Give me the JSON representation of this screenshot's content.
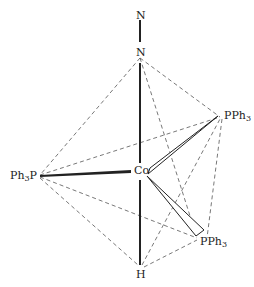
{
  "diagram": {
    "type": "molecular-structure",
    "atoms": {
      "n_terminal": {
        "label": "N",
        "x": 140,
        "y": 15
      },
      "n_bonded": {
        "label": "N",
        "x": 140,
        "y": 52
      },
      "co": {
        "label": "Co",
        "x": 140,
        "y": 170
      },
      "p_left": {
        "label": "Ph",
        "sub": "3",
        "tail": "P",
        "x": 38,
        "y": 175
      },
      "p_upper_right": {
        "label": "PPh",
        "sub": "3",
        "x": 222,
        "y": 116
      },
      "p_lower_right": {
        "label": "PPh",
        "sub": "3",
        "x": 200,
        "y": 242
      },
      "h": {
        "label": "H",
        "x": 140,
        "y": 275
      }
    },
    "bonds": [
      {
        "from": "n_terminal",
        "to": "n_bonded",
        "style": "solid"
      },
      {
        "from": "n_bonded",
        "to": "co",
        "style": "solid"
      },
      {
        "from": "co",
        "to": "h",
        "style": "solid"
      },
      {
        "from": "p_left",
        "to": "co",
        "style": "solid"
      },
      {
        "from": "co",
        "to": "p_upper_right",
        "style": "wedge-open"
      },
      {
        "from": "co",
        "to": "p_lower_right",
        "style": "wedge-open"
      }
    ],
    "polyhedron_edges": [
      [
        "n_bonded",
        "p_left"
      ],
      [
        "n_bonded",
        "p_upper_right"
      ],
      [
        "n_bonded",
        "p_lower_right"
      ],
      [
        "p_left",
        "p_upper_right"
      ],
      [
        "p_left",
        "p_lower_right"
      ],
      [
        "p_left",
        "h"
      ],
      [
        "h",
        "p_upper_right"
      ],
      [
        "h",
        "p_lower_right"
      ],
      [
        "p_upper_right",
        "p_lower_right"
      ]
    ],
    "colors": {
      "line": "#222222",
      "dash": "#555555",
      "background": "#ffffff"
    }
  }
}
